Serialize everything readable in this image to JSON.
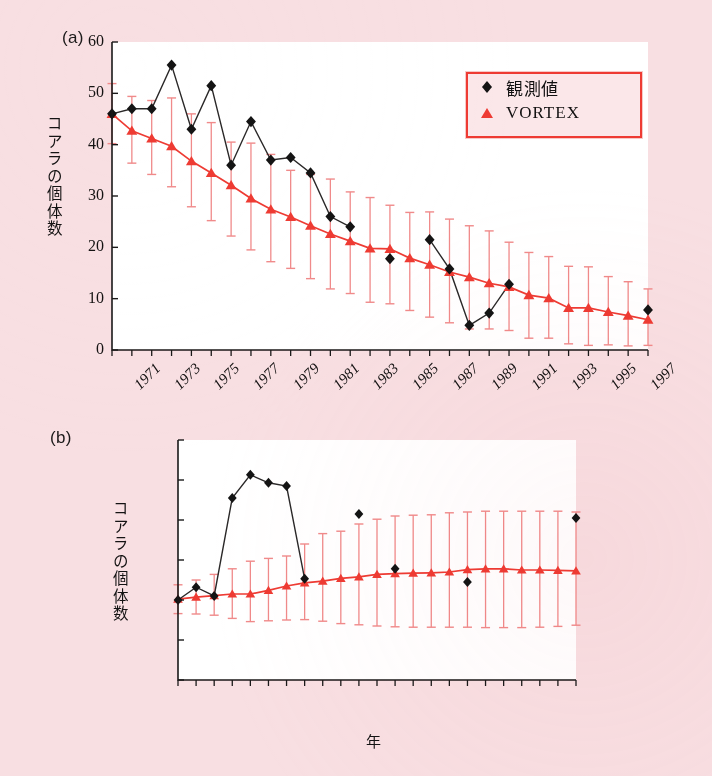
{
  "figure": {
    "background_color": "#f8dfe2",
    "observed_color": "#141414",
    "model_color": "#ee3b33",
    "errorbar_color": "#f08a8a"
  },
  "legend": {
    "position": "top-right-panel-a",
    "border_color": "#ee3b33",
    "entries": [
      {
        "label": "観測値",
        "marker": "diamond",
        "color": "#141414"
      },
      {
        "label": "VORTEX",
        "marker": "triangle",
        "color": "#ee3b33"
      }
    ]
  },
  "panels": [
    {
      "tag": "(a)"
    },
    {
      "tag": "(b)"
    }
  ],
  "chart_data": [
    {
      "type": "line",
      "panel": "(a)",
      "title": "",
      "xlabel": "",
      "ylabel": "コアラの個体数",
      "xlim": [
        1971,
        1998
      ],
      "ylim": [
        0,
        60
      ],
      "yticks": [
        0,
        10,
        20,
        30,
        40,
        50,
        60
      ],
      "xticks": [
        1971,
        1972,
        1973,
        1974,
        1975,
        1976,
        1977,
        1978,
        1979,
        1980,
        1981,
        1982,
        1983,
        1984,
        1985,
        1986,
        1987,
        1988,
        1989,
        1990,
        1991,
        1992,
        1993,
        1994,
        1995,
        1996,
        1997,
        1998
      ],
      "xticklabels": [
        "1971",
        "1973",
        "1975",
        "1977",
        "1979",
        "1981",
        "1983",
        "1985",
        "1987",
        "1989",
        "1991",
        "1993",
        "1995",
        "1997"
      ],
      "xticklabel_years": [
        1971,
        1973,
        1975,
        1977,
        1979,
        1981,
        1983,
        1985,
        1987,
        1989,
        1991,
        1993,
        1995,
        1997
      ],
      "grid": false,
      "x": [
        1971,
        1972,
        1973,
        1974,
        1975,
        1976,
        1977,
        1978,
        1979,
        1980,
        1981,
        1982,
        1983,
        1984,
        1985,
        1986,
        1987,
        1988,
        1989,
        1990,
        1991,
        1992,
        1993,
        1994,
        1995,
        1996,
        1997,
        1998
      ],
      "series": [
        {
          "name": "観測値",
          "marker": "diamond",
          "color": "#141414",
          "values": [
            46.0,
            47.0,
            47.0,
            55.5,
            43.0,
            51.5,
            36.0,
            44.5,
            37.0,
            37.5,
            34.5,
            26.0,
            24.0,
            null,
            17.8,
            null,
            21.5,
            15.8,
            4.8,
            7.2,
            12.8,
            null,
            null,
            null,
            null,
            null,
            null,
            7.8
          ]
        },
        {
          "name": "VORTEX",
          "marker": "triangle",
          "color": "#ee3b33",
          "values": [
            46.0,
            42.7,
            41.2,
            39.7,
            36.8,
            34.5,
            32.1,
            29.5,
            27.4,
            25.9,
            24.2,
            22.6,
            21.2,
            19.8,
            19.7,
            17.9,
            16.6,
            15.2,
            14.2,
            13.0,
            12.3,
            10.7,
            10.1,
            8.2,
            8.2,
            7.4,
            6.7,
            5.9
          ],
          "err_low": [
            40.2,
            36.4,
            34.2,
            31.8,
            27.9,
            25.2,
            22.2,
            19.5,
            17.2,
            15.9,
            13.9,
            11.9,
            11.0,
            9.3,
            9.0,
            7.7,
            6.4,
            5.3,
            4.1,
            4.1,
            3.8,
            2.3,
            2.3,
            1.2,
            0.9,
            1.0,
            0.8,
            0.9
          ],
          "err_high": [
            51.9,
            49.4,
            48.6,
            49.1,
            46.0,
            44.3,
            40.5,
            40.3,
            38.1,
            35.0,
            34.2,
            33.3,
            30.8,
            29.7,
            28.2,
            26.8,
            26.9,
            25.5,
            24.2,
            23.2,
            21.0,
            19.0,
            18.2,
            16.3,
            16.2,
            14.3,
            13.3,
            11.9
          ]
        }
      ]
    },
    {
      "type": "line",
      "panel": "(b)",
      "title": "",
      "xlabel": "年",
      "ylabel": "コアラの個体数",
      "xlim": [
        1976,
        1998
      ],
      "ylim": [
        0,
        60
      ],
      "yticks": [
        0,
        10,
        20,
        30,
        40,
        50,
        60
      ],
      "xticks": [
        1976,
        1977,
        1978,
        1979,
        1980,
        1981,
        1982,
        1983,
        1984,
        1985,
        1986,
        1987,
        1988,
        1989,
        1990,
        1991,
        1992,
        1993,
        1994,
        1995,
        1996,
        1997,
        1998
      ],
      "xticklabels": [
        "1976",
        "1980",
        "1984",
        "1988",
        "1992",
        "1996"
      ],
      "xticklabel_years": [
        1976,
        1980,
        1984,
        1988,
        1992,
        1996
      ],
      "grid": false,
      "x": [
        1976,
        1977,
        1978,
        1979,
        1980,
        1981,
        1982,
        1983,
        1984,
        1985,
        1986,
        1987,
        1988,
        1989,
        1990,
        1991,
        1992,
        1993,
        1994,
        1995,
        1996,
        1997,
        1998
      ],
      "series": [
        {
          "name": "観測値",
          "marker": "diamond",
          "color": "#141414",
          "values": [
            20.0,
            23.2,
            21.0,
            45.5,
            51.3,
            49.3,
            48.5,
            25.3,
            null,
            null,
            41.5,
            null,
            27.8,
            null,
            null,
            null,
            24.5,
            null,
            null,
            null,
            null,
            null,
            40.5
          ]
        },
        {
          "name": "VORTEX",
          "marker": "triangle",
          "color": "#ee3b33",
          "values": [
            20.2,
            20.7,
            21.1,
            21.5,
            21.5,
            22.4,
            23.5,
            24.3,
            24.7,
            25.4,
            25.8,
            26.4,
            26.6,
            26.7,
            26.8,
            27.0,
            27.6,
            27.8,
            27.8,
            27.5,
            27.5,
            27.4,
            27.3
          ],
          "err_low": [
            16.6,
            16.5,
            16.2,
            15.4,
            14.6,
            14.8,
            15.0,
            15.1,
            14.7,
            14.1,
            13.8,
            13.5,
            13.3,
            13.2,
            13.2,
            13.2,
            13.2,
            13.1,
            13.1,
            13.1,
            13.2,
            13.4,
            13.7
          ],
          "err_high": [
            23.8,
            25.0,
            26.4,
            27.8,
            29.7,
            30.4,
            31.0,
            34.0,
            36.6,
            37.2,
            39.0,
            40.2,
            41.0,
            41.2,
            41.3,
            41.8,
            42.0,
            42.2,
            42.2,
            42.2,
            42.2,
            42.2,
            42.0
          ]
        }
      ]
    }
  ]
}
